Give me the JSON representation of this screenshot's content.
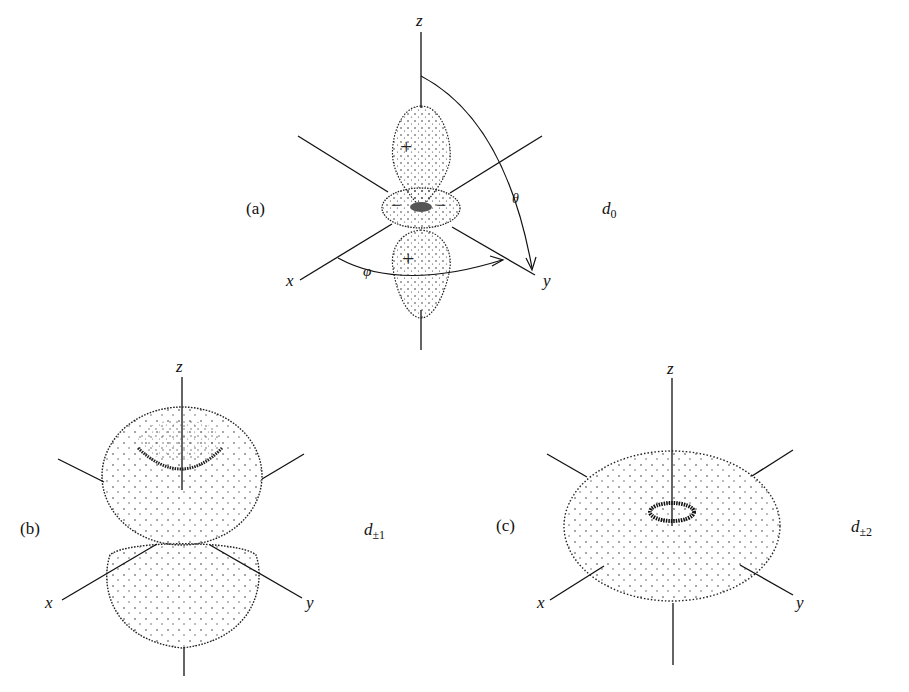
{
  "panels": [
    {
      "id": "a",
      "panel_label": "(a)",
      "orbital_symbol": "d",
      "orbital_subscript": "0",
      "axes": {
        "z": "z",
        "x": "x",
        "y": "y"
      },
      "angles": {
        "polar": "θ",
        "azimuthal": "φ"
      },
      "lobe_signs": {
        "upper": "+",
        "ring_left": "−",
        "ring_right": "−",
        "lower": "+"
      }
    },
    {
      "id": "b",
      "panel_label": "(b)",
      "orbital_symbol": "d",
      "orbital_subscript": "±1",
      "axes": {
        "z": "z",
        "x": "x",
        "y": "y"
      }
    },
    {
      "id": "c",
      "panel_label": "(c)",
      "orbital_symbol": "d",
      "orbital_subscript": "±2",
      "axes": {
        "z": "z",
        "x": "x",
        "y": "y"
      }
    }
  ],
  "style": {
    "ink": "#111111",
    "dot": "#222222",
    "background": "#ffffff"
  }
}
